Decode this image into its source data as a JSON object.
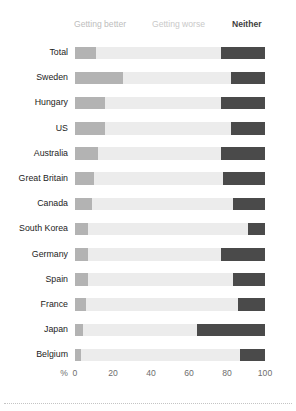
{
  "chart_data": {
    "type": "bar",
    "subtype": "stacked-horizontal-100",
    "title": "",
    "subtitle": "",
    "xlabel": "%",
    "ylabel": "",
    "xlim": [
      0,
      100
    ],
    "xticks": [
      0,
      20,
      40,
      60,
      80,
      100
    ],
    "xtick_labels": [
      "0",
      "20",
      "40",
      "60",
      "80",
      "100"
    ],
    "grid": false,
    "legend_position": "top",
    "categories": [
      "Total",
      "Sweden",
      "Hungary",
      "US",
      "Australia",
      "Great Britain",
      "Canada",
      "South Korea",
      "Germany",
      "Spain",
      "France",
      "Japan",
      "Belgium"
    ],
    "series": [
      {
        "name": "Getting better",
        "color": "#b3b3b3",
        "values": [
          11,
          25,
          16,
          16,
          12,
          10,
          9,
          7,
          7,
          7,
          6,
          4,
          3
        ]
      },
      {
        "name": "Getting worse",
        "color": "#ececec",
        "values": [
          66,
          57,
          61,
          66,
          65,
          68,
          74,
          84,
          70,
          76,
          80,
          60,
          84
        ]
      },
      {
        "name": "Neither",
        "color": "#4a4a4a",
        "values": [
          23,
          18,
          23,
          18,
          23,
          22,
          17,
          9,
          23,
          17,
          14,
          36,
          13
        ]
      }
    ]
  },
  "legend": {
    "better_label": "Getting better",
    "worse_label": "Getting worse",
    "neither_label": "Neither"
  },
  "axis": {
    "unit_label": "%"
  },
  "colors": {
    "better": "#b3b3b3",
    "worse": "#ececec",
    "neither": "#4a4a4a",
    "legend_muted": "#bdbdbd",
    "legend_strong": "#3f3f3f",
    "axis_text": "#6e6e6e",
    "label_text": "#1c1c1c",
    "background": "#ffffff"
  }
}
